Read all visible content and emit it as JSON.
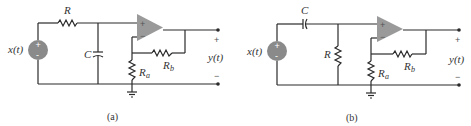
{
  "figure": {
    "circuits": [
      {
        "caption": "(a)",
        "components": {
          "series_element": "R",
          "shunt_element": "C",
          "gain_resistor_a": "R",
          "gain_resistor_a_sub": "a",
          "gain_resistor_b": "R",
          "gain_resistor_b_sub": "b"
        },
        "input_label": "x(t)",
        "output_label": "y(t)",
        "output_plus": "+",
        "output_minus": "−",
        "opamp_plus": "+",
        "opamp_minus": "−"
      },
      {
        "caption": "(b)",
        "components": {
          "series_element": "C",
          "shunt_element": "R",
          "gain_resistor_a": "R",
          "gain_resistor_a_sub": "a",
          "gain_resistor_b": "R",
          "gain_resistor_b_sub": "b"
        },
        "input_label": "x(t)",
        "output_label": "y(t)",
        "output_plus": "+",
        "output_minus": "−",
        "opamp_plus": "+",
        "opamp_minus": "−"
      }
    ],
    "colors": {
      "wire": "#2a2a2a",
      "source_fill": "#8a8a8a",
      "opamp_fill": "#9a9a9a"
    }
  }
}
